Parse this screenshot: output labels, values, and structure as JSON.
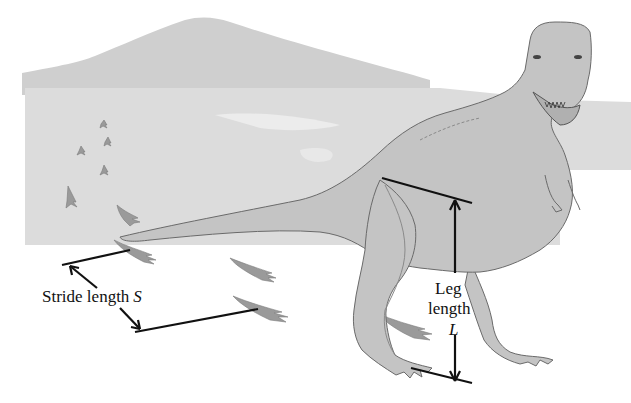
{
  "figure": {
    "colors": {
      "background": "#ffffff",
      "scenery": "#d9d9d9",
      "mountain": "#cfcfcf",
      "body_fill": "#c4c4c4",
      "outline": "#6a6a6a",
      "footprint": "#9a9a9a",
      "measure_line": "#111111"
    }
  },
  "labels": {
    "stride": {
      "text": "Stride length",
      "variable": "S"
    },
    "leg": {
      "line1": "Leg",
      "line2": "length",
      "variable": "L"
    }
  },
  "footprints": {
    "small_count": 5,
    "large_count": 5
  }
}
